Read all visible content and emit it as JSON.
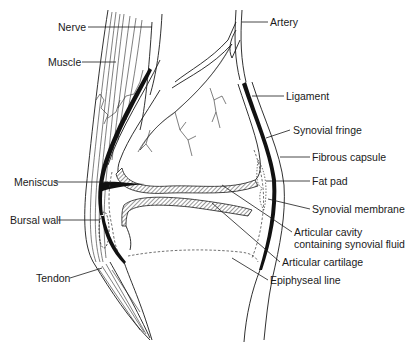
{
  "diagram": {
    "colors": {
      "ink": "#1a1a1a",
      "background": "#ffffff",
      "fill_black": "#111111"
    },
    "labels": {
      "nerve": "Nerve",
      "muscle": "Muscle",
      "meniscus": "Meniscus",
      "bursal_wall": "Bursal wall",
      "tendon": "Tendon",
      "artery": "Artery",
      "ligament": "Ligament",
      "synovial_fringe": "Synovial fringe",
      "fibrous_capsule": "Fibrous capsule",
      "fat_pad": "Fat pad",
      "synovial_membrane": "Synovial membrane",
      "articular_cavity_line1": "Articular cavity",
      "articular_cavity_line2": "containing synovial fluid",
      "articular_cartilage": "Articular cartilage",
      "epiphyseal_line": "Epiphyseal line"
    }
  }
}
